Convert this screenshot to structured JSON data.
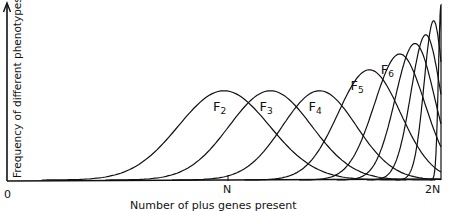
{
  "chart_data": {
    "type": "line",
    "title": "",
    "xlabel": "Number of plus genes present",
    "ylabel": "Frequency of different phenotypes",
    "x_ticks": [
      {
        "label": "0",
        "pos": 0
      },
      {
        "label": "N",
        "pos": 0.5
      },
      {
        "label": "2N",
        "pos": 1.0
      }
    ],
    "grid": false,
    "legend": "inline curve labels",
    "series": [
      {
        "name": "F2",
        "label": "F",
        "sub": "2",
        "peak_x": 0.5,
        "peak_h": 0.51,
        "width": 0.105
      },
      {
        "name": "F3",
        "label": "F",
        "sub": "3",
        "peak_x": 0.607,
        "peak_h": 0.51,
        "width": 0.095
      },
      {
        "name": "F4",
        "label": "F",
        "sub": "4",
        "peak_x": 0.72,
        "peak_h": 0.51,
        "width": 0.085
      },
      {
        "name": "F5",
        "label": "F",
        "sub": "5",
        "peak_x": 0.835,
        "peak_h": 0.63,
        "width": 0.072
      },
      {
        "name": "F6",
        "label": "F",
        "sub": "6",
        "peak_x": 0.905,
        "peak_h": 0.72,
        "width": 0.058
      },
      {
        "name": "F7",
        "label": "",
        "sub": "",
        "peak_x": 0.94,
        "peak_h": 0.78,
        "width": 0.045
      },
      {
        "name": "F8",
        "label": "",
        "sub": "",
        "peak_x": 0.965,
        "peak_h": 0.83,
        "width": 0.034
      },
      {
        "name": "F9",
        "label": "",
        "sub": "",
        "peak_x": 0.983,
        "peak_h": 0.91,
        "width": 0.022
      },
      {
        "name": "Fn",
        "label": "",
        "sub": "",
        "peak_x": 1.0,
        "peak_h": 1.0,
        "width": 0.006
      }
    ]
  },
  "axes": {
    "origin_label": "0",
    "mid_label": "N",
    "end_label": "2N",
    "xlabel": "Number of plus genes present",
    "ylabel": "Frequency of different phenotypes"
  }
}
